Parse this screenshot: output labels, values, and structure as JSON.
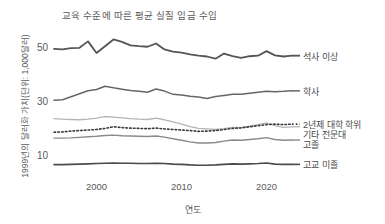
{
  "chart_data": {
    "type": "line",
    "title": "교육 수준에 따른 평균 실질 임금 수입",
    "xlabel": "연도",
    "ylabel": "1999년의 달러화 가치(단위: 1,000달러)",
    "xticks": [
      "2000",
      "2010",
      "2020"
    ],
    "xtick_values": [
      2000,
      2010,
      2020
    ],
    "yticks": [
      "10",
      "30",
      "50"
    ],
    "ytick_values": [
      10,
      30,
      50
    ],
    "xlim": [
      1995,
      2023
    ],
    "ylim": [
      3,
      57
    ],
    "grid": false,
    "legend_position": "right-inline",
    "x": [
      1995,
      1996,
      1997,
      1998,
      1999,
      2000,
      2001,
      2002,
      2003,
      2004,
      2005,
      2006,
      2007,
      2008,
      2009,
      2010,
      2011,
      2012,
      2013,
      2014,
      2015,
      2016,
      2017,
      2018,
      2019,
      2020,
      2021,
      2022,
      2023
    ],
    "series": [
      {
        "name": "석사 이상",
        "label": "석사 이상",
        "color": "#555555",
        "style": "solid",
        "width": 1.8,
        "values": [
          50.0,
          49.8,
          50.3,
          50.4,
          52.8,
          48.5,
          51.0,
          53.5,
          52.6,
          51.3,
          51.0,
          50.8,
          52.0,
          49.8,
          49.0,
          48.6,
          48.0,
          47.5,
          47.2,
          46.4,
          48.3,
          47.3,
          46.7,
          47.3,
          47.5,
          49.2,
          47.6,
          47.2,
          47.5
        ]
      },
      {
        "name": "학사",
        "label": "학사",
        "color": "#666666",
        "style": "solid",
        "width": 1.5,
        "values": [
          31.0,
          31.2,
          32.3,
          33.4,
          34.5,
          35.0,
          36.2,
          35.6,
          35.1,
          34.6,
          34.3,
          34.0,
          35.2,
          34.4,
          33.2,
          33.0,
          32.5,
          32.2,
          31.7,
          32.4,
          32.8,
          33.2,
          33.2,
          33.6,
          34.0,
          34.3,
          34.2,
          34.3,
          34.5
        ]
      },
      {
        "name": "기타 전문대",
        "label": "기타 전문대",
        "color": "#b4b4b4",
        "style": "solid",
        "width": 1.3,
        "values": [
          24.2,
          24.0,
          23.9,
          23.8,
          24.0,
          24.4,
          25.0,
          24.8,
          24.5,
          24.2,
          24.0,
          23.9,
          24.4,
          23.8,
          23.0,
          22.2,
          21.3,
          20.6,
          20.4,
          20.2,
          20.5,
          21.0,
          20.9,
          21.4,
          22.0,
          22.6,
          21.6,
          21.0,
          21.2
        ]
      },
      {
        "name": "2년제 대학 학위",
        "label": "2년제 대학 학위",
        "color": "#3a3a3a",
        "style": "dotted",
        "width": 1.6,
        "values": [
          19.2,
          19.3,
          19.6,
          19.8,
          20.0,
          20.2,
          20.6,
          21.2,
          20.9,
          20.7,
          20.6,
          20.5,
          20.7,
          20.4,
          20.2,
          20.0,
          19.8,
          19.5,
          19.6,
          19.8,
          20.2,
          20.6,
          20.8,
          21.2,
          21.6,
          22.0,
          22.2,
          22.0,
          22.2
        ]
      },
      {
        "name": "고졸",
        "label": "고졸",
        "color": "#8a8a8a",
        "style": "solid",
        "width": 1.4,
        "values": [
          17.0,
          17.0,
          17.1,
          17.3,
          17.5,
          17.7,
          18.0,
          18.1,
          17.9,
          17.8,
          17.7,
          17.6,
          17.8,
          17.4,
          16.8,
          16.2,
          15.6,
          15.2,
          15.2,
          15.4,
          15.9,
          16.3,
          16.2,
          16.5,
          16.8,
          17.2,
          16.5,
          16.2,
          16.3
        ]
      },
      {
        "name": "고교 미졸",
        "label": "고교 미졸",
        "color": "#4a4a4a",
        "style": "solid",
        "width": 1.6,
        "values": [
          7.2,
          7.2,
          7.3,
          7.4,
          7.5,
          7.6,
          7.7,
          7.8,
          7.7,
          7.7,
          7.6,
          7.6,
          7.7,
          7.6,
          7.4,
          7.3,
          7.1,
          7.0,
          7.0,
          7.1,
          7.3,
          7.5,
          7.4,
          7.5,
          7.6,
          7.8,
          7.4,
          7.3,
          7.3
        ]
      }
    ]
  }
}
